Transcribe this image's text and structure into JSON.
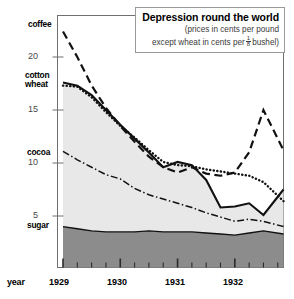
{
  "title": {
    "main": "Depression round the world",
    "sub_line1": "(prices in cents per pound",
    "sub_line2_pre": "except wheat in cents per",
    "frac_num": "1",
    "frac_den": "8",
    "sub_line2_post": "bushel)"
  },
  "axes": {
    "x_axis_label": "year",
    "y_ticks": [
      "20",
      "15",
      "10",
      "5"
    ],
    "x_ticks": [
      "1929",
      "1930",
      "1931",
      "1932"
    ]
  },
  "series_labels": {
    "coffee": "coffee",
    "cotton": "cotton",
    "wheat": "wheat",
    "cocoa": "cocoa",
    "sugar": "sugar"
  },
  "colors": {
    "line": "#111111",
    "sugar_fill": "#8c8c8c",
    "body_fill": "#e8e8e8",
    "axis": "#6f6f6f",
    "title_border": "#9a9a9a",
    "subtitle_text": "#3a3a3a"
  },
  "chart_data": {
    "type": "line",
    "title": "Depression round the world",
    "subtitle": "(prices in cents per pound except wheat in cents per 1/8 bushel)",
    "xlabel": "year",
    "ylabel": "",
    "xlim": [
      1929.0,
      1932.85
    ],
    "ylim": [
      0,
      23
    ],
    "y_tick_values": [
      5,
      10,
      15,
      20
    ],
    "x_tick_values": [
      1929,
      1930,
      1931,
      1932
    ],
    "x_minor_tick_interval": 0.25,
    "grid": false,
    "legend": "inline-labels-left",
    "x": [
      1929.0,
      1929.25,
      1929.5,
      1929.75,
      1930.0,
      1930.25,
      1930.5,
      1930.75,
      1931.0,
      1931.25,
      1931.5,
      1931.75,
      1932.0,
      1932.25,
      1932.5,
      1932.85
    ],
    "series": [
      {
        "name": "coffee",
        "style": "dashed",
        "values": [
          22.4,
          20.0,
          17.3,
          15.2,
          13.5,
          12.0,
          10.6,
          9.6,
          9.1,
          9.6,
          9.0,
          8.8,
          9.1,
          11.0,
          15.0,
          11.2
        ]
      },
      {
        "name": "cotton",
        "style": "solid",
        "values": [
          17.6,
          17.3,
          16.4,
          15.0,
          13.6,
          12.3,
          11.0,
          9.6,
          10.1,
          9.8,
          8.4,
          5.8,
          5.9,
          6.2,
          5.1,
          7.5
        ]
      },
      {
        "name": "wheat",
        "style": "dotted",
        "values": [
          17.3,
          17.2,
          16.2,
          14.8,
          13.5,
          12.4,
          11.2,
          10.1,
          9.8,
          9.7,
          9.4,
          9.2,
          9.0,
          8.8,
          8.2,
          6.4
        ]
      },
      {
        "name": "cocoa",
        "style": "dash-dot",
        "values": [
          11.1,
          10.3,
          9.6,
          8.9,
          8.5,
          7.6,
          7.0,
          6.6,
          6.2,
          5.8,
          5.3,
          4.9,
          4.5,
          4.7,
          4.5,
          4.0
        ]
      },
      {
        "name": "sugar",
        "style": "filled-area",
        "values": [
          4.0,
          3.8,
          3.6,
          3.5,
          3.5,
          3.5,
          3.6,
          3.5,
          3.5,
          3.5,
          3.4,
          3.3,
          3.2,
          3.4,
          3.6,
          3.3
        ]
      }
    ]
  }
}
